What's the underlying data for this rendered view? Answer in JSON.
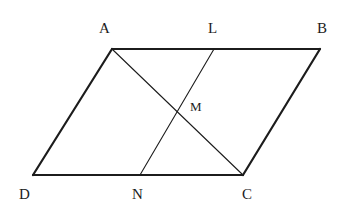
{
  "figure": {
    "type": "geometry-diagram",
    "shape": "parallelogram",
    "background_color": "#ffffff",
    "stroke_color": "#1c1c1c",
    "outer_stroke_width": 2.2,
    "inner_stroke_width": 1.1,
    "canvas": {
      "width": 354,
      "height": 214
    }
  },
  "points": {
    "A": {
      "label": "A",
      "x": 112,
      "y": 49
    },
    "B": {
      "label": "B",
      "x": 320,
      "y": 49
    },
    "C": {
      "label": "C",
      "x": 243,
      "y": 175
    },
    "D": {
      "label": "D",
      "x": 33,
      "y": 175
    },
    "L": {
      "label": "L",
      "x": 214,
      "y": 49
    },
    "M": {
      "label": "M",
      "x": 175,
      "y": 111
    },
    "N": {
      "label": "N",
      "x": 140,
      "y": 175
    }
  },
  "segments": [
    {
      "name": "AB",
      "from": "A",
      "to": "B",
      "weight": "thick"
    },
    {
      "name": "BC",
      "from": "B",
      "to": "C",
      "weight": "thick"
    },
    {
      "name": "CD",
      "from": "C",
      "to": "D",
      "weight": "thick"
    },
    {
      "name": "DA",
      "from": "D",
      "to": "A",
      "weight": "thick"
    },
    {
      "name": "AC",
      "from": "A",
      "to": "C",
      "weight": "thin"
    },
    {
      "name": "LN",
      "from": "L",
      "to": "N",
      "weight": "thin"
    }
  ],
  "labels": {
    "A": "A",
    "L": "L",
    "B": "B",
    "M": "M",
    "D": "D",
    "N": "N",
    "C": "C"
  }
}
